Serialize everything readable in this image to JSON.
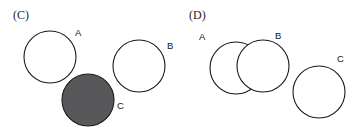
{
  "figure": {
    "width": 359,
    "height": 132,
    "background_color": "#ffffff",
    "stroke_color": "#1a1a1a",
    "shade_color": "#58585a"
  },
  "panels": [
    {
      "id": "C",
      "caption": "(C)",
      "description": "Three mutually disjoint circles; circle C is shaded",
      "circles": [
        {
          "label": "A",
          "cx": 50,
          "cy": 57,
          "r": 26,
          "shaded": false,
          "label_x": 75,
          "label_y": 28
        },
        {
          "label": "B",
          "cx": 139,
          "cy": 66,
          "r": 26,
          "shaded": false,
          "label_x": 167,
          "label_y": 41
        },
        {
          "label": "C",
          "cx": 88,
          "cy": 100,
          "r": 26,
          "shaded": true,
          "label_x": 117,
          "label_y": 101
        }
      ]
    },
    {
      "id": "D",
      "caption": "(D)",
      "description": "Circles A and B overlap with the part of A outside B shaded; circle C is disjoint and unshaded",
      "circles": [
        {
          "label": "A",
          "cx": 56,
          "cy": 68,
          "r": 26,
          "shaded": true,
          "label_x": 19,
          "label_y": 32
        },
        {
          "label": "B",
          "cx": 83,
          "cy": 66,
          "r": 26,
          "shaded": false,
          "label_x": 95,
          "label_y": 31
        },
        {
          "label": "C",
          "cx": 139,
          "cy": 92,
          "r": 26,
          "shaded": false,
          "label_x": 157,
          "label_y": 54
        }
      ]
    }
  ],
  "labels": {
    "panel_c_caption": "(C)",
    "panel_c_a": "A",
    "panel_c_b": "B",
    "panel_c_c": "C",
    "panel_d_caption": "(D)",
    "panel_d_a": "A",
    "panel_d_b": "B",
    "panel_d_c": "C"
  }
}
